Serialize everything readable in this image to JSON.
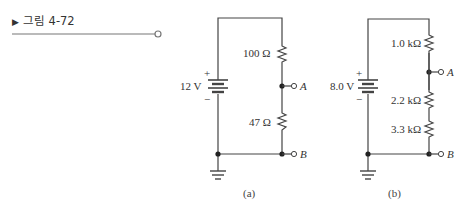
{
  "figure": {
    "label": "그림 4-72",
    "marker": "▶"
  },
  "circuit_a": {
    "caption": "(a)",
    "source": {
      "value": "12 V",
      "plus": "+",
      "minus": "−"
    },
    "resistors": [
      {
        "label": "100 Ω"
      },
      {
        "label": "47 Ω"
      }
    ],
    "terminals": [
      {
        "label": "A"
      },
      {
        "label": "B"
      }
    ]
  },
  "circuit_b": {
    "caption": "(b)",
    "source": {
      "value": "8.0 V",
      "plus": "+",
      "minus": "−"
    },
    "resistors": [
      {
        "label": "1.0 kΩ"
      },
      {
        "label": "2.2 kΩ"
      },
      {
        "label": "3.3 kΩ"
      }
    ],
    "terminals": [
      {
        "label": "A"
      },
      {
        "label": "B"
      }
    ]
  },
  "colors": {
    "wire": "#444444",
    "text": "#333333"
  }
}
